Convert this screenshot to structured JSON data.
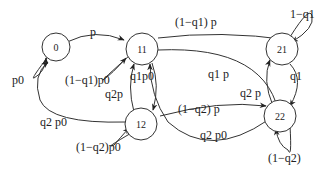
{
  "diagram": {
    "type": "state-transition",
    "nodes": [
      {
        "id": "0",
        "label": "0"
      },
      {
        "id": "11",
        "label": "11"
      },
      {
        "id": "12",
        "label": "12"
      },
      {
        "id": "21",
        "label": "21"
      },
      {
        "id": "22",
        "label": "22"
      }
    ],
    "edges": [
      {
        "from": "0",
        "to": "11",
        "label": "p"
      },
      {
        "from": "0",
        "to": "0",
        "label": "p0"
      },
      {
        "from": "11",
        "to": "11",
        "label": "(1−q1)p0"
      },
      {
        "from": "11",
        "to": "21",
        "label": "(1−q1) p"
      },
      {
        "from": "11",
        "to": "22",
        "label": "q1 p"
      },
      {
        "from": "11",
        "to": "12",
        "label": "q1p0"
      },
      {
        "from": "12",
        "to": "11",
        "label": "q2p"
      },
      {
        "from": "12",
        "to": "0",
        "label": "q2 p0"
      },
      {
        "from": "12",
        "to": "12",
        "label": "(1−q2)p0"
      },
      {
        "from": "12",
        "to": "22",
        "label": "(1−q2) p"
      },
      {
        "from": "22",
        "to": "11",
        "label": "q2 p0"
      },
      {
        "from": "22",
        "to": "21",
        "label": "q2 p"
      },
      {
        "from": "21",
        "to": "22",
        "label": "q1"
      },
      {
        "from": "21",
        "to": "21",
        "label": "1−q1"
      },
      {
        "from": "22",
        "to": "22",
        "label": "(1−q2)"
      }
    ]
  }
}
